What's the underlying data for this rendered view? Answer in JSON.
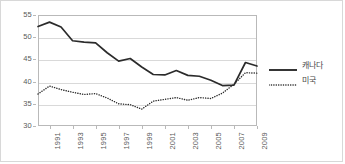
{
  "chart_data": {
    "type": "line",
    "title": "",
    "xlabel": "",
    "ylabel": "",
    "ylim": [
      30,
      55
    ],
    "yticks": [
      30,
      35,
      40,
      45,
      50,
      55
    ],
    "xlim": [
      1990,
      2009
    ],
    "x": [
      1990,
      1991,
      1992,
      1993,
      1994,
      1995,
      1996,
      1997,
      1998,
      1999,
      2000,
      2001,
      2002,
      2003,
      2004,
      2005,
      2006,
      2007,
      2008,
      2009
    ],
    "xticks": [
      1991,
      1993,
      1995,
      1997,
      1999,
      2001,
      2003,
      2005,
      2007,
      2009
    ],
    "xtick_labels": [
      "1991",
      "1993",
      "1995",
      "1997",
      "1999",
      "2001",
      "2003",
      "2005",
      "2007",
      "2009"
    ],
    "grid": "horizontal",
    "legend_position": "right",
    "series": [
      {
        "name": "캐나다",
        "style": "solid",
        "color": "#2b2b2b",
        "values": [
          52.4,
          53.4,
          52.3,
          49.2,
          48.9,
          48.7,
          46.5,
          44.6,
          45.2,
          43.3,
          41.6,
          41.5,
          42.5,
          41.4,
          41.2,
          40.3,
          39.1,
          39.2,
          44.3,
          43.5
        ]
      },
      {
        "name": "미국",
        "style": "dotted",
        "color": "#2b2b2b",
        "values": [
          37.2,
          39.0,
          38.2,
          37.6,
          37.1,
          37.3,
          36.3,
          35.0,
          34.8,
          33.8,
          35.6,
          36.0,
          36.4,
          35.8,
          36.4,
          36.2,
          37.4,
          39.4,
          42.0,
          41.9
        ]
      }
    ]
  },
  "legend": {
    "items": [
      {
        "label": "캐나다",
        "style": "solid"
      },
      {
        "label": "미국",
        "style": "dotted"
      }
    ]
  }
}
